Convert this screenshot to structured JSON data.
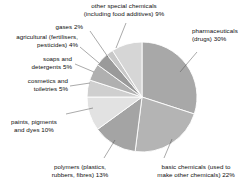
{
  "chart_data": {
    "type": "pie",
    "title": "",
    "subtitle": "",
    "xlabel": "",
    "ylabel": "",
    "legend_position": "none",
    "grid": false,
    "units": "percent",
    "start_angle_deg": 0,
    "direction": "clockwise",
    "categories": [
      "pharmaceuticals (drugs)",
      "basic chemicals (used to make other chemicals)",
      "polymers (plastics, rubbers, fibres)",
      "paints, pigments and dyes",
      "cosmetics and toiletries",
      "soaps and detergents",
      "agricultural (fertilisers, pesticides)",
      "gases",
      "other special chemicals (including food additives)"
    ],
    "values": [
      30,
      22,
      13,
      10,
      5,
      5,
      4,
      2,
      9
    ],
    "colors": [
      "#a8a8a8",
      "#b4b4b4",
      "#a4a4a4",
      "#e2e2e2",
      "#cfcfcf",
      "#b0b0b0",
      "#9a9a9a",
      "#c8c8c8",
      "#d6d6d6"
    ],
    "slice_border_color": "#ffffff",
    "leader_line_color": "#555555",
    "background": "#ffffff"
  },
  "labels": {
    "other_special": "other special chemicals\n(including food additives) 9%",
    "gases": "gases 2%",
    "agricultural": "agricultural (fertilisers,\npesticides) 4%",
    "soaps": "soaps and\ndetergents 5%",
    "cosmetics": "cosmetics and\ntoiletries 5%",
    "paints": "paints, pigments\nand dyes 10%",
    "polymers": "polymers (plastics,\nrubbers, fibres) 13%",
    "basic": "basic chemicals (used to\nmake other chemicals) 22%",
    "pharmaceuticals": "pharmaceuticals\n(drugs) 30%"
  }
}
